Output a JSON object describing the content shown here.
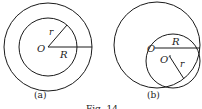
{
  "diagram_a": {
    "caption": "(a)",
    "center_label": "O",
    "inner_radius_label": "r",
    "outer_radius_label": "R",
    "description": "Two concentric circles centered at O; inner radius r, outer radius R"
  },
  "diagram_b": {
    "caption": "(b)",
    "outer_center_label": "O",
    "inner_center_label": "O′",
    "outer_radius_label": "R",
    "inner_radius_label": "r",
    "description": "Large circle centered at O with radius R; smaller circle centered at O′ with radius r, internally tangent"
  },
  "figure_caption": "Fig. 14"
}
